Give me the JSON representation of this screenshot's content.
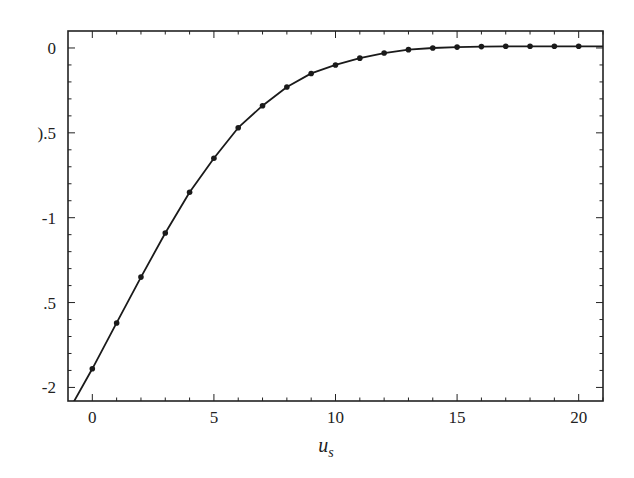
{
  "chart_data": {
    "type": "line",
    "title": "",
    "xlabel": "u_s",
    "xlabel_main": "u",
    "xlabel_sub": "s",
    "ylabel": "",
    "xlim": [
      -1.0,
      21.0
    ],
    "ylim": [
      -2.08,
      0.1
    ],
    "grid": false,
    "legend": null,
    "x_ticks": [
      0,
      5,
      10,
      15,
      20
    ],
    "x_tick_labels": [
      "0",
      "5",
      "10",
      "15",
      "20"
    ],
    "y_ticks": [
      0,
      -0.5,
      -1,
      -1.5,
      -2
    ],
    "y_tick_labels": [
      "0",
      ").5",
      "-1",
      ".5",
      "-2"
    ],
    "series": [
      {
        "name": "curve",
        "style": "line",
        "x": [
          -0.9,
          0,
          1,
          2,
          3,
          4,
          5,
          6,
          7,
          8,
          9,
          10,
          11,
          12,
          13,
          14,
          15,
          16,
          17,
          18,
          19,
          20,
          21
        ],
        "y": [
          -2.12,
          -1.89,
          -1.62,
          -1.35,
          -1.09,
          -0.85,
          -0.65,
          -0.47,
          -0.34,
          -0.23,
          -0.15,
          -0.1,
          -0.06,
          -0.03,
          -0.01,
          0.0,
          0.005,
          0.008,
          0.01,
          0.01,
          0.01,
          0.01,
          0.01
        ]
      },
      {
        "name": "points",
        "style": "markers",
        "x": [
          0,
          1,
          2,
          3,
          4,
          5,
          6,
          7,
          8,
          9,
          10,
          11,
          12,
          13,
          14,
          15,
          16,
          17,
          18,
          19,
          20
        ],
        "y": [
          -1.89,
          -1.62,
          -1.35,
          -1.09,
          -0.85,
          -0.65,
          -0.47,
          -0.34,
          -0.23,
          -0.15,
          -0.1,
          -0.06,
          -0.03,
          -0.01,
          0.0,
          0.005,
          0.008,
          0.01,
          0.01,
          0.01,
          0.01
        ]
      }
    ]
  },
  "colors": {
    "line": "#1a1a1a",
    "axis": "#222222",
    "background": "#ffffff"
  }
}
